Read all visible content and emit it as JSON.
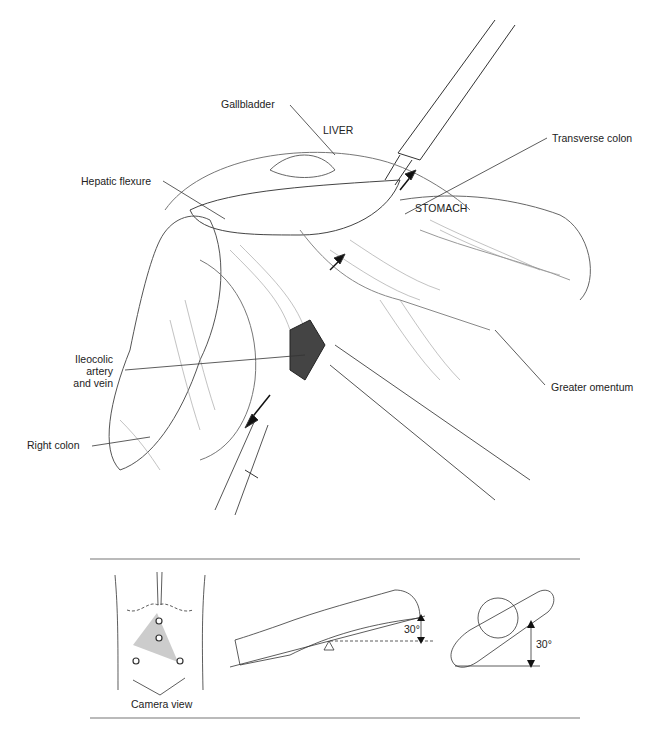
{
  "illustration": {
    "labels": {
      "gallbladder": "Gallbladder",
      "liver": "LIVER",
      "transverse_colon": "Transverse colon",
      "hepatic_flexure": "Hepatic flexure",
      "stomach": "STOMACH",
      "ileocolic_1": "Ileocolic",
      "ileocolic_2": "artery",
      "ileocolic_3": "and vein",
      "greater_omentum": "Greater omentum",
      "right_colon": "Right colon"
    }
  },
  "inset": {
    "camera_view_label": "Camera view",
    "tilt_angle_1": "30°",
    "tilt_angle_2": "30°"
  }
}
